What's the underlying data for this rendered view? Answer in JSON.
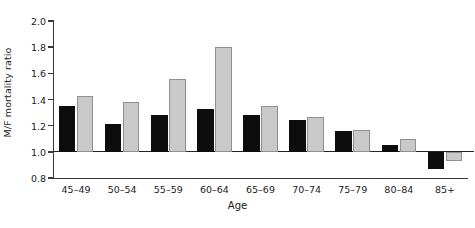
{
  "chart_data": {
    "type": "bar",
    "title": "",
    "xlabel": "Age",
    "ylabel": "M/F mortality ratio",
    "categories": [
      "45–49",
      "50–54",
      "55–59",
      "60–64",
      "65–69",
      "70–74",
      "75–79",
      "80–84",
      "85+"
    ],
    "series": [
      {
        "name": "dark",
        "color": "#0d0d0d",
        "values": [
          1.35,
          1.21,
          1.28,
          1.33,
          1.28,
          1.24,
          1.16,
          1.05,
          0.87
        ]
      },
      {
        "name": "light",
        "color": "#c9c9c9",
        "values": [
          1.43,
          1.38,
          1.56,
          1.8,
          1.35,
          1.27,
          1.17,
          1.1,
          0.93
        ]
      }
    ],
    "ylim": [
      0.8,
      2.0
    ],
    "yticks": [
      "2.0",
      "1.8",
      "1.6",
      "1.4",
      "1.2",
      "1.0",
      "0.8"
    ],
    "ytick_values": [
      2.0,
      1.8,
      1.6,
      1.4,
      1.2,
      1.0,
      0.8
    ],
    "baseline": 1.0,
    "grid": false,
    "legend": "none"
  }
}
